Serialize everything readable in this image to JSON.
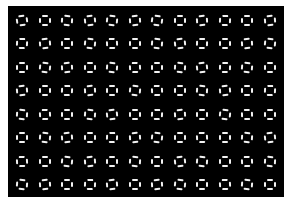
{
  "image": {
    "description": "Grid of small square outlines formed by four white dashes on a black background",
    "background_color": "#000000",
    "border_color": "#ffffff",
    "shape_color": "#f2f2f2",
    "grid": {
      "columns": 12,
      "rows": 8,
      "first_center": [
        22,
        20
      ],
      "spacing": [
        22.5,
        23.5
      ]
    },
    "shape": "dashed-square",
    "rotations_deg": [
      [
        -8,
        0,
        4,
        -6,
        6,
        -4,
        8,
        0,
        -4,
        3,
        0,
        -5
      ],
      [
        3,
        -5,
        0,
        6,
        -3,
        0,
        5,
        -6,
        2,
        0,
        -4,
        6
      ],
      [
        0,
        6,
        -4,
        0,
        5,
        -3,
        0,
        4,
        -6,
        2,
        5,
        0
      ],
      [
        -5,
        0,
        3,
        -4,
        0,
        6,
        -3,
        0,
        4,
        -5,
        0,
        3
      ],
      [
        4,
        -3,
        0,
        5,
        -6,
        0,
        3,
        -4,
        0,
        6,
        -2,
        0
      ],
      [
        0,
        5,
        -5,
        0,
        3,
        -4,
        6,
        0,
        -3,
        0,
        4,
        -6
      ],
      [
        -3,
        0,
        6,
        -5,
        0,
        4,
        0,
        -6,
        5,
        0,
        -3,
        4
      ],
      [
        5,
        -4,
        0,
        3,
        -5,
        0,
        -4,
        6,
        0,
        -3,
        5,
        0
      ]
    ]
  }
}
